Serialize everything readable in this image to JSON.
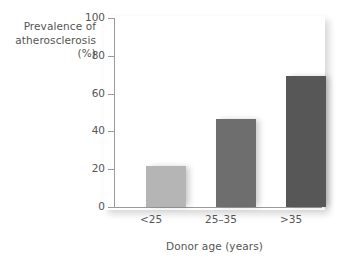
{
  "chart_data": {
    "type": "bar",
    "title": "",
    "categories": [
      "<25",
      "25–35",
      ">35"
    ],
    "values": [
      21.5,
      46.5,
      69.5
    ],
    "series": [
      {
        "name": "Prevalence of atherosclerosis (%)",
        "values": [
          21.5,
          46.5,
          69.5
        ]
      }
    ],
    "xlabel": "Donor age (years)",
    "ylabel_lines": [
      "Prevalence of",
      "atherosclerosis",
      "(%)"
    ],
    "ylabel": "Prevalence of atherosclerosis (%)",
    "ylim": [
      0,
      100
    ],
    "yticks": [
      0,
      20,
      40,
      60,
      80,
      100
    ],
    "ytick_labels": [
      "0",
      "20",
      "40",
      "60",
      "80",
      "100"
    ],
    "grid": false,
    "legend": "none",
    "bar_colors": [
      "#b5b5b5",
      "#6e6e6e",
      "#575757"
    ],
    "axis_color": "#9a9a9a",
    "text_color": "#555555",
    "panel_color": "#ffffff"
  }
}
